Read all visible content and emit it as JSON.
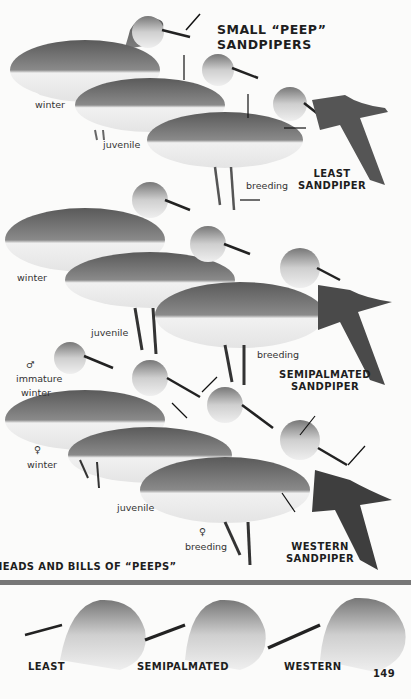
{
  "page": {
    "title": "SMALL “PEEP” SANDPIPERS",
    "page_number": "149",
    "section_heading": "HEADS AND BILLS OF “PEEPS”"
  },
  "species": [
    {
      "name_line1": "LEAST",
      "name_line2": "SANDPIPER",
      "labels": {
        "winter": "winter",
        "juvenile": "juvenile",
        "breeding": "breeding"
      }
    },
    {
      "name_line1": "SEMIPALMATED",
      "name_line2": "SANDPIPER",
      "labels": {
        "winter": "winter",
        "juvenile": "juvenile",
        "breeding": "breeding",
        "immature_sex": "♂",
        "immature": "immature",
        "immature_winter": "winter"
      }
    },
    {
      "name_line1": "WESTERN",
      "name_line2": "SANDPIPER",
      "labels": {
        "winter_sex": "♀",
        "winter": "winter",
        "juvenile": "juvenile",
        "breeding_sex": "♀",
        "breeding": "breeding"
      }
    }
  ],
  "heads": [
    {
      "label": "LEAST"
    },
    {
      "label": "SEMIPALMATED"
    },
    {
      "label": "WESTERN"
    }
  ],
  "colors": {
    "background": "#fbfbfa",
    "ink": "#1e1e1e",
    "divider": "#777777"
  }
}
